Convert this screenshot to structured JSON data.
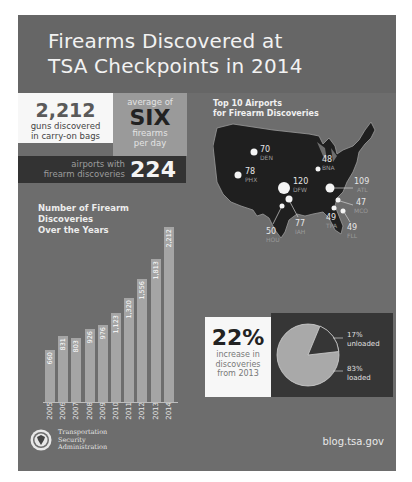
{
  "title": {
    "line1": "Firearms Discovered at",
    "line2": "TSA Checkpoints in 2014"
  },
  "stats": {
    "guns": {
      "value": "2,212",
      "line1": "guns discovered",
      "line2": "in carry-on bags"
    },
    "average": {
      "top": "average of",
      "value": "SIX",
      "line1": "firearms",
      "line2": "per day"
    },
    "airports": {
      "line1": "airports with",
      "line2": "firearm discoveries",
      "value": "224"
    }
  },
  "map": {
    "title_line1": "Top 10 Airports",
    "title_line2": "for Firearm Discoveries",
    "airports": [
      {
        "code": "DEN",
        "count": "70"
      },
      {
        "code": "PHX",
        "count": "78"
      },
      {
        "code": "DFW",
        "count": "120"
      },
      {
        "code": "BNA",
        "count": "48"
      },
      {
        "code": "ATL",
        "count": "109"
      },
      {
        "code": "MCO",
        "count": "47"
      },
      {
        "code": "TPA",
        "count": "49"
      },
      {
        "code": "FLL",
        "count": "49"
      },
      {
        "code": "IAH",
        "count": "77"
      },
      {
        "code": "HOU",
        "count": "50"
      }
    ]
  },
  "bar_chart": {
    "title_line1": "Number of Firearm",
    "title_line2": "Discoveries",
    "title_line3": "Over the Years"
  },
  "increase": {
    "value": "22%",
    "line1": "increase in",
    "line2": "discoveries",
    "line3": "from 2013"
  },
  "pie": {
    "unloaded_pct": "17%",
    "unloaded_label": "unloaded",
    "loaded_pct": "83%",
    "loaded_label": "loaded"
  },
  "footer": {
    "agency_line1": "Transportation",
    "agency_line2": "Security",
    "agency_line3": "Administration",
    "url": "blog.tsa.gov"
  },
  "colors": {
    "panel": "#6d6d6d",
    "title_band": "#666666",
    "bar": "#a5a5a5",
    "dark_box": "#333333",
    "light_box": "#f7f7f7"
  },
  "chart_data": [
    {
      "type": "bar",
      "title": "Number of Firearm Discoveries Over the Years",
      "xlabel": "",
      "ylabel": "",
      "categories": [
        "2005",
        "2006",
        "2007",
        "2008",
        "2009",
        "2010",
        "2011",
        "2012",
        "2013",
        "2014"
      ],
      "values": [
        660,
        831,
        803,
        926,
        976,
        1123,
        1320,
        1556,
        1813,
        2212
      ],
      "value_labels": [
        "660",
        "831",
        "803",
        "926",
        "976",
        "1,123",
        "1,320",
        "1,556",
        "1,813",
        "2,212"
      ],
      "grid": false,
      "ylim": [
        0,
        2300
      ]
    },
    {
      "type": "pie",
      "title": "Loaded vs unloaded firearms",
      "categories": [
        "unloaded",
        "loaded"
      ],
      "values": [
        17,
        83
      ]
    },
    {
      "type": "scatter",
      "title": "Top 10 Airports for Firearm Discoveries",
      "categories": [
        "DFW",
        "ATL",
        "PHX",
        "IAH",
        "DEN",
        "HOU",
        "TPA",
        "FLL",
        "BNA",
        "MCO"
      ],
      "values": [
        120,
        109,
        78,
        77,
        70,
        50,
        49,
        49,
        48,
        47
      ]
    }
  ]
}
